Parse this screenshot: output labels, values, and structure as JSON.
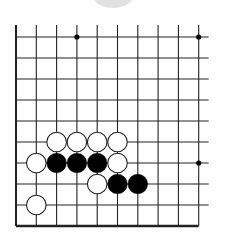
{
  "board": {
    "columns": 10,
    "rows": 10,
    "origin_x": 16,
    "origin_y": 37,
    "spacing_x": 20.3,
    "spacing_y": 21,
    "line_color": "#222222",
    "edges": {
      "left": true,
      "bottom": true,
      "top": false,
      "right": false
    },
    "star_points": [
      {
        "col": 3,
        "row": 0
      },
      {
        "col": 9,
        "row": 0
      },
      {
        "col": 9,
        "row": 6
      }
    ],
    "stones": [
      {
        "color": "white",
        "col": 2,
        "row": 5
      },
      {
        "color": "white",
        "col": 3,
        "row": 5
      },
      {
        "color": "white",
        "col": 4,
        "row": 5
      },
      {
        "color": "white",
        "col": 5,
        "row": 5
      },
      {
        "color": "white",
        "col": 1,
        "row": 6
      },
      {
        "color": "black",
        "col": 2,
        "row": 6
      },
      {
        "color": "black",
        "col": 3,
        "row": 6
      },
      {
        "color": "black",
        "col": 4,
        "row": 6
      },
      {
        "color": "white",
        "col": 5,
        "row": 6
      },
      {
        "color": "white",
        "col": 4,
        "row": 7
      },
      {
        "color": "black",
        "col": 5,
        "row": 7
      },
      {
        "color": "black",
        "col": 6,
        "row": 7
      },
      {
        "color": "white",
        "col": 1,
        "row": 8
      }
    ],
    "colors": {
      "black_stone": "#000000",
      "white_stone": "#ffffff",
      "white_outline": "#222222"
    }
  }
}
